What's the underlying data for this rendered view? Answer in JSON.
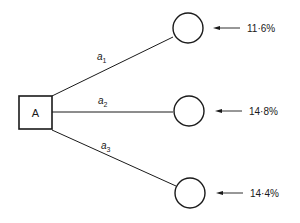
{
  "diagram": {
    "type": "decision-tree",
    "decision_node": {
      "label": "A"
    },
    "branches": [
      {
        "label": "a",
        "subscript": "1",
        "outcome": "11·6%"
      },
      {
        "label": "a",
        "subscript": "2",
        "outcome": "14·8%"
      },
      {
        "label": "a",
        "subscript": "3",
        "outcome": "14·4%"
      }
    ]
  }
}
